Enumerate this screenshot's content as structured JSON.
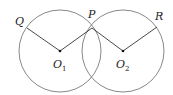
{
  "diagram": {
    "circles": [
      {
        "name": "circle-1",
        "cx": 60,
        "cy": 51,
        "r": 41
      },
      {
        "name": "circle-2",
        "cx": 123,
        "cy": 51,
        "r": 41
      }
    ],
    "points": {
      "Q": {
        "label": "Q",
        "x": 27,
        "y": 28
      },
      "P": {
        "label": "P",
        "x": 92,
        "y": 28
      },
      "R": {
        "label": "R",
        "x": 157,
        "y": 27
      },
      "O1": {
        "label": "O",
        "sub": "1",
        "x": 60,
        "y": 51
      },
      "O2": {
        "label": "O",
        "sub": "2",
        "x": 123,
        "y": 51
      }
    },
    "segments": [
      "Q-O1",
      "O1-P",
      "P-O2",
      "O2-R"
    ],
    "colors": {
      "circle": "#7a7a7a",
      "segment": "#333333",
      "point": "#111111"
    }
  }
}
